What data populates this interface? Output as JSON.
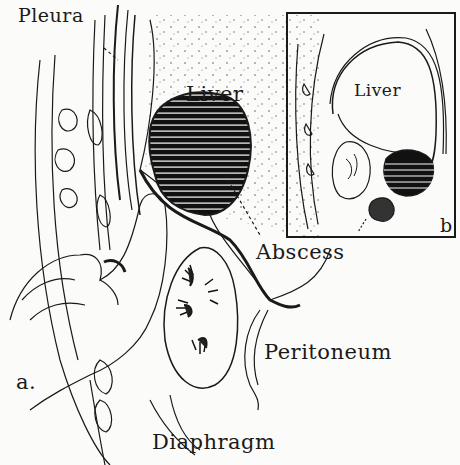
{
  "figure": {
    "panel_a": {
      "label": "a.",
      "annotations": {
        "pleura": "Pleura",
        "liver": "Liver",
        "abscess": "Abscess",
        "peritoneum": "Peritoneum",
        "diaphragm": "Diaphragm"
      }
    },
    "panel_b": {
      "label": "b",
      "annotations": {
        "liver": "Liver"
      }
    },
    "colors": {
      "ink": "#1a1a1a",
      "paper": "#fbfbf9"
    }
  }
}
